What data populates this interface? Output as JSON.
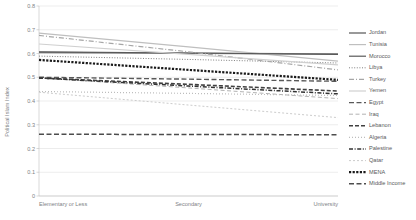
{
  "chart_data": {
    "type": "line",
    "title": "",
    "xlabel": "",
    "ylabel": "Political Islam Index",
    "categories": [
      "Elementary or Less",
      "Secondary",
      "University"
    ],
    "ylim": [
      0,
      0.8
    ],
    "yticks": [
      "0",
      "0.1",
      "0.2",
      "0.3",
      "0.4",
      "0.5",
      "0.6",
      "0.7",
      "0.8"
    ],
    "ytick_values": [
      0,
      0.1,
      0.2,
      0.3,
      0.4,
      0.5,
      0.6,
      0.7,
      0.8
    ],
    "grid": true,
    "legend_position": "right",
    "series": [
      {
        "name": "Jordan",
        "values": [
          0.604,
          0.601,
          0.598
        ],
        "color": "#7f7f7f",
        "dash": "none",
        "width": 1.6
      },
      {
        "name": "Tunisia",
        "values": [
          0.686,
          0.628,
          0.568
        ],
        "color": "#bfbfbf",
        "dash": "none",
        "width": 1.2
      },
      {
        "name": "Morocco",
        "values": [
          0.607,
          0.602,
          0.596
        ],
        "color": "#595959",
        "dash": "none",
        "width": 1.2
      },
      {
        "name": "Libya",
        "values": [
          0.589,
          0.575,
          0.56
        ],
        "color": "#7f7f7f",
        "dash": "1,1.6",
        "width": 1.0
      },
      {
        "name": "Turkey",
        "values": [
          0.676,
          0.607,
          0.531
        ],
        "color": "#a6a6a6",
        "dash": "5,2,1,2",
        "width": 1.2
      },
      {
        "name": "Yemen",
        "values": [
          0.64,
          0.596,
          0.552
        ],
        "color": "#d0d0d0",
        "dash": "none",
        "width": 1.2
      },
      {
        "name": "Egypt",
        "values": [
          0.5,
          0.492,
          0.483
        ],
        "color": "#595959",
        "dash": "5,2.5",
        "width": 1.4
      },
      {
        "name": "Iraq",
        "values": [
          0.498,
          0.455,
          0.41
        ],
        "color": "#b3b3b3",
        "dash": "4,2.5",
        "width": 1.0
      },
      {
        "name": "Lebanon",
        "values": [
          0.497,
          0.47,
          0.442
        ],
        "color": "#404040",
        "dash": "4,2",
        "width": 1.6
      },
      {
        "name": "Algeria",
        "values": [
          0.44,
          0.432,
          0.423
        ],
        "color": "#bdbdbd",
        "dash": "1,2",
        "width": 1.2
      },
      {
        "name": "Palestine",
        "values": [
          0.497,
          0.463,
          0.43
        ],
        "color": "#333333",
        "dash": "4,1.6,1,1.6",
        "width": 1.5
      },
      {
        "name": "Qatar",
        "values": [
          0.437,
          0.383,
          0.33
        ],
        "color": "#cccccc",
        "dash": "2,2",
        "width": 1.0
      },
      {
        "name": "MENA",
        "values": [
          0.573,
          0.531,
          0.489
        ],
        "color": "#1a1a1a",
        "dash": "2.2,1.4",
        "width": 2.2
      },
      {
        "name": "Middle Income",
        "values": [
          0.26,
          0.259,
          0.258
        ],
        "color": "#4d4d4d",
        "dash": "5,2.5",
        "width": 1.5
      }
    ]
  }
}
